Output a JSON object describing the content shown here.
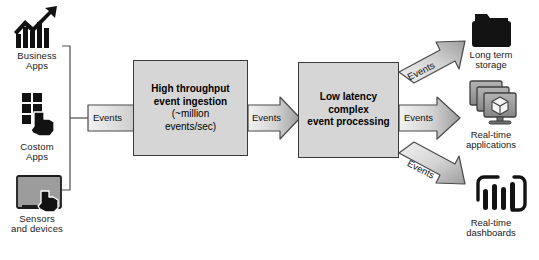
{
  "diagram": {
    "colors": {
      "box_fill": "#d6d6d6",
      "box_stroke": "#3a3a3a",
      "arrow_fill_light": "#ededed",
      "arrow_fill_dark": "#9a9a9a",
      "arrow_stroke": "#4a4a4a",
      "icon_dark": "#111111",
      "icon_gray": "#8c8c8c",
      "text": "#1a1a1a",
      "background": "#ffffff"
    },
    "sources": [
      {
        "id": "business-apps",
        "icon": "bar-chart-growth-icon",
        "label_lines": [
          "Business",
          "Apps"
        ]
      },
      {
        "id": "custom-apps",
        "icon": "app-grid-touch-icon",
        "label_lines": [
          "Costom",
          "Apps"
        ]
      },
      {
        "id": "sensors-devices",
        "icon": "tablet-touch-icon",
        "label_lines": [
          "Sensors",
          "and devices"
        ]
      }
    ],
    "stages": [
      {
        "id": "ingestion",
        "lines": [
          {
            "text": "High throughput",
            "bold": true
          },
          {
            "text": "event ingestion",
            "bold": true
          },
          {
            "text": "(~million",
            "bold": false
          },
          {
            "text": "events/sec)",
            "bold": false
          }
        ]
      },
      {
        "id": "processing",
        "lines": [
          {
            "text": "Low latency",
            "bold": true
          },
          {
            "text": "complex",
            "bold": true
          },
          {
            "text": "event processing",
            "bold": true
          }
        ]
      }
    ],
    "flows": [
      {
        "id": "flow-in",
        "label": "Events",
        "direction": "right"
      },
      {
        "id": "flow-mid",
        "label": "Events",
        "direction": "right"
      },
      {
        "id": "flow-out-up",
        "label": "Events",
        "direction": "up-right"
      },
      {
        "id": "flow-out-mid",
        "label": "Events",
        "direction": "right"
      },
      {
        "id": "flow-out-down",
        "label": "Events",
        "direction": "down-right"
      }
    ],
    "outputs": [
      {
        "id": "long-term-storage",
        "icon": "folder-icon",
        "label_lines": [
          "Long term",
          "storage"
        ]
      },
      {
        "id": "realtime-applications",
        "icon": "monitor-stack-cube-icon",
        "label_lines": [
          "Real-time",
          "applications"
        ]
      },
      {
        "id": "realtime-dashboards",
        "icon": "dashboard-bars-icon",
        "label_lines": [
          "Real-time",
          "dashboards"
        ]
      }
    ]
  }
}
